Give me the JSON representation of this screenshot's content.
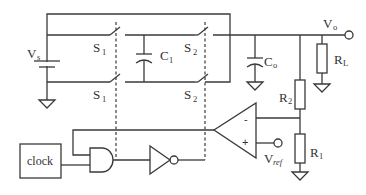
{
  "diagram": {
    "type": "switched-capacitor voltage regulator schematic",
    "components": {
      "source": {
        "label": "V",
        "sub": "s"
      },
      "switch_s1_top": {
        "label": "S",
        "sub": "1"
      },
      "switch_s1_bottom": {
        "label": "S",
        "sub": "1"
      },
      "switch_s2_top": {
        "label": "S",
        "sub": "2"
      },
      "switch_s2_bottom": {
        "label": "S",
        "sub": "2"
      },
      "flying_cap": {
        "label": "C",
        "sub": "1"
      },
      "output_cap": {
        "label": "C",
        "sub": "o"
      },
      "load_resistor": {
        "label": "R",
        "sub": "L"
      },
      "divider_top": {
        "label": "R",
        "sub": "2"
      },
      "divider_bottom": {
        "label": "R",
        "sub": "1"
      },
      "output_node": {
        "label": "V",
        "sub": "o"
      },
      "reference": {
        "label": "V",
        "sub": "ref"
      },
      "comparator": {
        "minus": "-",
        "plus": "+"
      },
      "clock": {
        "label": "clock"
      },
      "and_gate": {},
      "inverter": {}
    }
  }
}
